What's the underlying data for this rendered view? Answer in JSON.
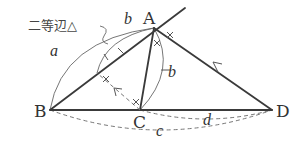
{
  "diagram": {
    "title_note": "二等辺△",
    "points": [
      {
        "id": "A",
        "label": "A",
        "x": 154,
        "y": 28
      },
      {
        "id": "B",
        "label": "B",
        "x": 50,
        "y": 110
      },
      {
        "id": "C",
        "label": "C",
        "x": 140,
        "y": 110
      },
      {
        "id": "D",
        "label": "D",
        "x": 272,
        "y": 110
      }
    ],
    "segments": [
      {
        "from": "B",
        "to": "A",
        "style": "solid",
        "extended": true
      },
      {
        "from": "A",
        "to": "C",
        "style": "solid"
      },
      {
        "from": "B",
        "to": "D",
        "style": "solid"
      },
      {
        "from": "A",
        "to": "D",
        "style": "solid",
        "arrow": "toward A"
      },
      {
        "from": "C",
        "to": "BA-point",
        "style": "dashed",
        "arrow": "toward BA"
      }
    ],
    "length_labels": {
      "a": "a",
      "b_top": "b",
      "b_right": "b",
      "c": "c",
      "d": "d"
    },
    "point_labels": {
      "A": "A",
      "B": "B",
      "C": "C",
      "D": "D"
    },
    "markings": "× tick marks indicate equal angles"
  }
}
